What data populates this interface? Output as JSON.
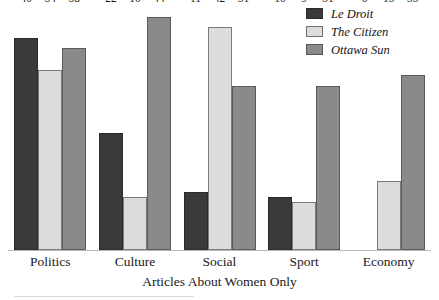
{
  "chart_data": {
    "type": "bar",
    "title": "",
    "xlabel": "Articles About Women Only",
    "ylabel": "",
    "ylim": [
      0,
      46
    ],
    "grid": false,
    "legend_position": "top-right",
    "categories": [
      "Politics",
      "Culture",
      "Social",
      "Sport",
      "Economy"
    ],
    "series": [
      {
        "name": "Le Droit",
        "color": "#3a3a3a",
        "values": [
          40,
          22,
          11,
          10,
          0
        ]
      },
      {
        "name": "The Citizen",
        "color": "#dcdcdc",
        "values": [
          34,
          10,
          42,
          9,
          13
        ]
      },
      {
        "name": "Ottawa Sun",
        "color": "#8a8a8a",
        "values": [
          38,
          44,
          31,
          31,
          33
        ]
      }
    ],
    "value_labels": [
      "40",
      "34",
      "38",
      "22",
      "10",
      "44",
      "11",
      "42",
      "31",
      "10",
      "9",
      "31",
      "0",
      "13",
      "33"
    ]
  },
  "legend": {
    "items": [
      {
        "label": "Le Droit"
      },
      {
        "label": "The Citizen"
      },
      {
        "label": "Ottawa Sun"
      }
    ]
  },
  "axis": {
    "title": "Articles About Women Only"
  }
}
